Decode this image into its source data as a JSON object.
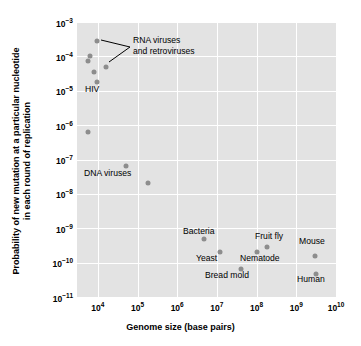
{
  "chart": {
    "type": "scatter",
    "title": "",
    "xlabel": "Genome size (base pairs)",
    "ylabel_line1": "Probability of new mutation at a particular nucleotide",
    "ylabel_line2": "in each round of replication",
    "background": "#e3e3e3",
    "gridcolor": "#ffffff",
    "markercolor": "#8d8d8d",
    "xlim": [
      3000,
      10000000000
    ],
    "ylim": [
      1e-11,
      0.001
    ],
    "xscale": "log",
    "yscale": "log",
    "grid": true,
    "legend": "none"
  },
  "xticks": [
    {
      "label": "10",
      "exp": "4",
      "value": 10000
    },
    {
      "label": "10",
      "exp": "5",
      "value": 100000
    },
    {
      "label": "10",
      "exp": "6",
      "value": 1000000
    },
    {
      "label": "10",
      "exp": "7",
      "value": 10000000
    },
    {
      "label": "10",
      "exp": "8",
      "value": 100000000
    },
    {
      "label": "10",
      "exp": "9",
      "value": 1000000000
    },
    {
      "label": "10",
      "exp": "10",
      "value": 10000000000
    }
  ],
  "yticks": [
    {
      "label": "10",
      "exp": "−3",
      "value": 0.001
    },
    {
      "label": "10",
      "exp": "−4",
      "value": 0.0001
    },
    {
      "label": "10",
      "exp": "−5",
      "value": 1e-05
    },
    {
      "label": "10",
      "exp": "−6",
      "value": 1e-06
    },
    {
      "label": "10",
      "exp": "−7",
      "value": 1e-07
    },
    {
      "label": "10",
      "exp": "−8",
      "value": 1e-08
    },
    {
      "label": "10",
      "exp": "−9",
      "value": 1e-09
    },
    {
      "label": "10",
      "exp": "−10",
      "value": 1e-10
    },
    {
      "label": "10",
      "exp": "−11",
      "value": 1e-11
    }
  ],
  "chart_data": {
    "type": "scatter",
    "title": "",
    "xlabel": "Genome size (base pairs)",
    "ylabel": "Probability of new mutation at a particular nucleotide in each round of replication",
    "xscale": "log",
    "yscale": "log",
    "xlim": [
      3000,
      10000000000
    ],
    "ylim": [
      1e-11,
      0.001
    ],
    "grid": true,
    "legend_position": "none",
    "points": [
      {
        "name": "RNA virus 1",
        "x": 9500,
        "y": 0.00028,
        "group": "RNA viruses and retroviruses"
      },
      {
        "name": "RNA virus 2",
        "x": 6300,
        "y": 0.0001,
        "group": "RNA viruses and retroviruses"
      },
      {
        "name": "RNA virus 3",
        "x": 5800,
        "y": 7.5e-05,
        "group": "RNA viruses and retroviruses"
      },
      {
        "name": "RNA virus 4",
        "x": 7800,
        "y": 3.5e-05,
        "group": "RNA viruses and retroviruses"
      },
      {
        "name": "RNA virus 5",
        "x": 16000,
        "y": 4.8e-05,
        "group": "RNA viruses and retroviruses"
      },
      {
        "name": "HIV",
        "x": 9700,
        "y": 1.8e-05,
        "group": "HIV"
      },
      {
        "name": "DNA virus 1",
        "x": 5600,
        "y": 6.2e-07,
        "group": "DNA viruses"
      },
      {
        "name": "DNA virus 2",
        "x": 50000,
        "y": 6.5e-08,
        "group": "DNA viruses"
      },
      {
        "name": "DNA virus 3",
        "x": 180000,
        "y": 2.1e-08,
        "group": "DNA viruses"
      },
      {
        "name": "Bacteria",
        "x": 4800000,
        "y": 4.8e-10,
        "group": "Bacteria"
      },
      {
        "name": "Yeast",
        "x": 12000000,
        "y": 2e-10,
        "group": "Yeast"
      },
      {
        "name": "Bread mold",
        "x": 40000000,
        "y": 6.5e-11,
        "group": "Bread mold"
      },
      {
        "name": "Nematode",
        "x": 100000000,
        "y": 2e-10,
        "group": "Nematode"
      },
      {
        "name": "Fruit fly",
        "x": 180000000,
        "y": 2.9e-10,
        "group": "Fruit fly"
      },
      {
        "name": "Mouse",
        "x": 2900000000,
        "y": 1.6e-10,
        "group": "Mouse"
      },
      {
        "name": "Human",
        "x": 3100000000,
        "y": 4.8e-11,
        "group": "Human"
      }
    ],
    "annotations": [
      {
        "text": "RNA viruses and retroviruses",
        "points": [
          "RNA virus 1",
          "RNA virus 5"
        ]
      },
      {
        "text": "HIV",
        "points": [
          "HIV"
        ]
      },
      {
        "text": "DNA viruses",
        "points": [
          "DNA virus 2",
          "DNA virus 3"
        ]
      },
      {
        "text": "Bacteria",
        "points": [
          "Bacteria"
        ]
      },
      {
        "text": "Yeast",
        "points": [
          "Yeast"
        ]
      },
      {
        "text": "Bread mold",
        "points": [
          "Bread mold"
        ]
      },
      {
        "text": "Nematode",
        "points": [
          "Nematode"
        ]
      },
      {
        "text": "Fruit fly",
        "points": [
          "Fruit fly"
        ]
      },
      {
        "text": "Mouse",
        "points": [
          "Mouse"
        ]
      },
      {
        "text": "Human",
        "points": [
          "Human"
        ]
      }
    ]
  },
  "annotations": {
    "rna_line1": "RNA viruses",
    "rna_line2": "and retroviruses",
    "hiv": "HIV",
    "dna": "DNA viruses",
    "bacteria": "Bacteria",
    "yeast": "Yeast",
    "bread_mold": "Bread mold",
    "nematode": "Nematode",
    "fruit_fly": "Fruit fly",
    "mouse": "Mouse",
    "human": "Human"
  }
}
